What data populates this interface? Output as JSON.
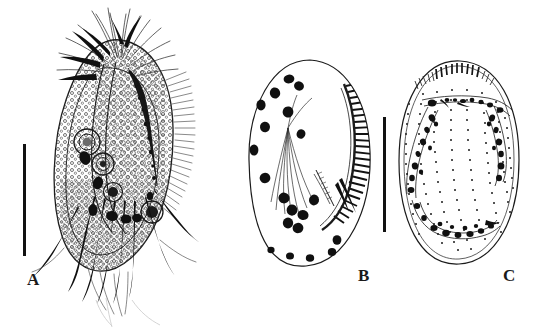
{
  "figure": {
    "type": "scientific-illustration-plate",
    "background_color": "#ffffff",
    "ink_color": "#1b1b1b",
    "width": 540,
    "height": 328,
    "panel_count": 3
  },
  "panels": [
    {
      "id": "A",
      "label": "A",
      "label_position": {
        "x": 27,
        "y": 270
      },
      "subject": "whole-animal-lateral-view",
      "description": "Stippled ovoid body bearing long radiating setae at the anterior margin, several stout dark spines, internal organ outlines and dark curved claws ventrally",
      "bounds": {
        "x": 48,
        "y": 14,
        "width": 135,
        "height": 290
      },
      "scale_bar": {
        "x": 23,
        "y": 144,
        "width": 3,
        "height": 112,
        "orientation": "vertical",
        "color": "#121212"
      }
    },
    {
      "id": "B",
      "label": "B",
      "label_position": {
        "x": 358,
        "y": 266
      },
      "subject": "valve-inner-view",
      "description": "Oval valve outline with scattered dark muscle scars, a fan of fine radiating lines from a central node, and a dense hatched marginal comb along the right edge",
      "bounds": {
        "x": 248,
        "y": 58,
        "width": 125,
        "height": 212
      },
      "scale_bar": null
    },
    {
      "id": "C",
      "label": "C",
      "label_position": {
        "x": 503,
        "y": 266
      },
      "subject": "valve-outer-view",
      "description": "Oval valve outline with vertical rows of dotted pores, a short hatched comb at the dorsal margin, and speckled arched band structures",
      "bounds": {
        "x": 398,
        "y": 60,
        "width": 122,
        "height": 205
      },
      "scale_bar": {
        "x": 383,
        "y": 117,
        "width": 3,
        "height": 115,
        "orientation": "vertical",
        "color": "#121212"
      }
    }
  ],
  "scale_bars": [
    {
      "belongs_to": "A",
      "x": 23,
      "y": 144,
      "length_px": 112
    },
    {
      "belongs_to": "B-C",
      "x": 383,
      "y": 117,
      "length_px": 115
    }
  ],
  "labels": {
    "a": "A",
    "b": "B",
    "c": "C"
  }
}
